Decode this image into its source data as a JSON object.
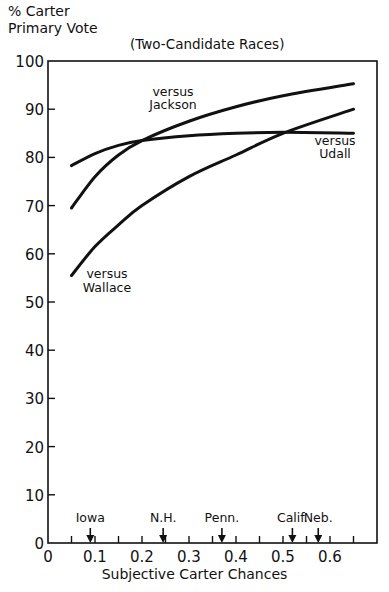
{
  "chart_data": {
    "type": "line",
    "title": "(Two-Candidate Races)",
    "ylabel": "% Carter Primary Vote",
    "xlabel": "Subjective Carter Chances",
    "xlim": [
      0,
      0.7
    ],
    "ylim": [
      0,
      100
    ],
    "xticks": [
      "0",
      "0.1",
      "0.2",
      "0.3",
      "0.4",
      "0.5",
      "0.6"
    ],
    "yticks": [
      "0",
      "10",
      "20",
      "30",
      "40",
      "50",
      "60",
      "70",
      "80",
      "90",
      "100"
    ],
    "grid": false,
    "legend": "inline labels",
    "x": [
      0.05,
      0.1,
      0.15,
      0.2,
      0.3,
      0.4,
      0.5,
      0.65
    ],
    "series": [
      {
        "name": "versus Jackson",
        "values": [
          69.5,
          76,
          80.5,
          83.5,
          87.5,
          90.5,
          92.8,
          95.3
        ]
      },
      {
        "name": "versus Udall",
        "values": [
          78.3,
          80.8,
          82.5,
          83.5,
          84.5,
          85,
          85.2,
          85
        ]
      },
      {
        "name": "versus Wallace",
        "values": [
          55.5,
          61.5,
          66,
          70,
          76,
          80.5,
          85,
          90
        ]
      }
    ],
    "annotations": [
      {
        "label": "Iowa",
        "x": 0.09
      },
      {
        "label": "N.H.",
        "x": 0.245
      },
      {
        "label": "Penn.",
        "x": 0.37
      },
      {
        "label": "Calif.",
        "x": 0.52
      },
      {
        "label": "Neb.",
        "x": 0.575
      }
    ]
  },
  "labels": {
    "ylabel_line1": "% Carter",
    "ylabel_line2": "Primary Vote",
    "title": "(Two-Candidate Races)",
    "xlabel": "Subjective Carter Chances",
    "versus": "versus",
    "jackson": "Jackson",
    "udall": "Udall",
    "wallace": "Wallace"
  }
}
